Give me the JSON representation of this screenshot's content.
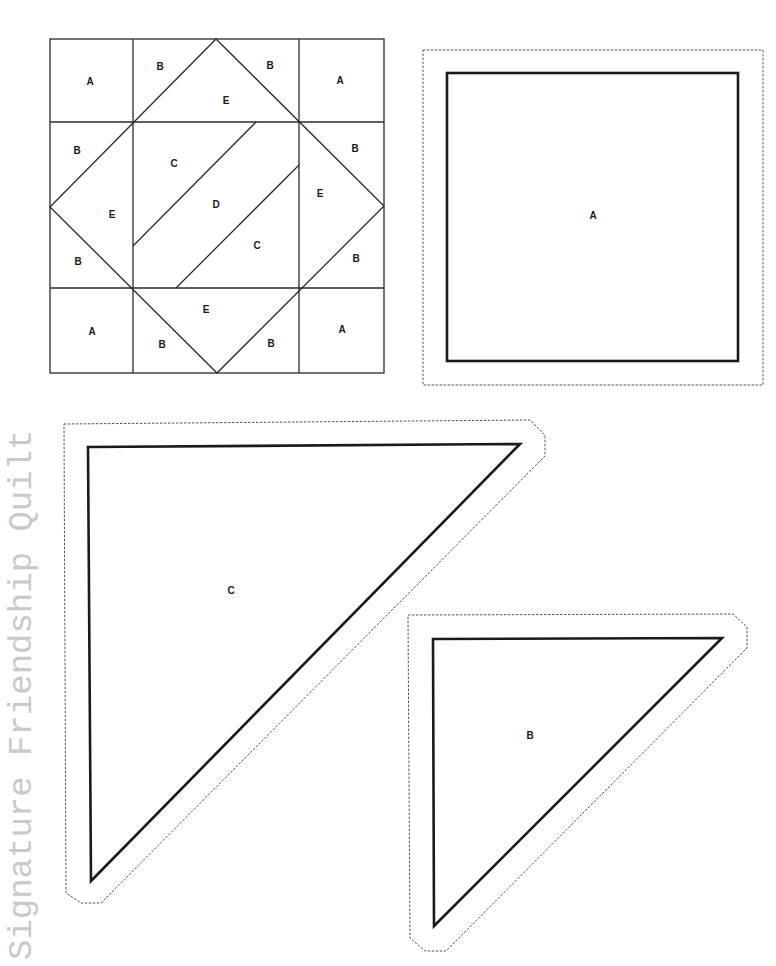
{
  "page": {
    "title": "Signature Friendship Quilt",
    "colors": {
      "background": "#ffffff",
      "line": "#1a1a1a",
      "title_text": "#c9c9c9"
    }
  },
  "block_diagram": {
    "labels": {
      "a_tl": "A",
      "b_top_left": "B",
      "b_top_right": "B",
      "a_tr": "A",
      "e_top": "E",
      "b_left_top": "B",
      "c_upper": "C",
      "b_right_top": "B",
      "e_left": "E",
      "d_center": "D",
      "e_right": "E",
      "c_lower": "C",
      "b_left_bottom": "B",
      "b_right_bottom": "B",
      "a_bl": "A",
      "e_bottom": "E",
      "b_bottom_left": "B",
      "b_bottom_right": "B",
      "a_br": "A"
    }
  },
  "templates": {
    "square_a": {
      "label": "A"
    },
    "triangle_c": {
      "label": "C"
    },
    "triangle_b": {
      "label": "B"
    }
  }
}
